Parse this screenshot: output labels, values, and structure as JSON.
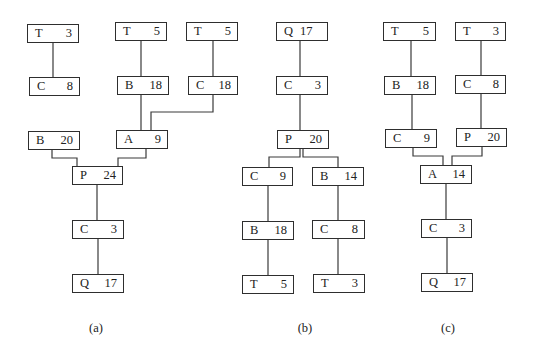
{
  "diagram": {
    "title": "",
    "colors": {
      "line": "#3a3a3a",
      "box_border": "#2e2e2e",
      "text": "#222222",
      "background": "#ffffff"
    },
    "panels": [
      {
        "id": "a",
        "caption": "(a)",
        "caption_pos": [
          96,
          321
        ],
        "nodes": [
          {
            "id": "a_t3",
            "label": "T",
            "value": "3",
            "x": 27,
            "y": 24,
            "w": 52
          },
          {
            "id": "a_t5_1",
            "label": "T",
            "value": "5",
            "x": 115,
            "y": 22,
            "w": 52
          },
          {
            "id": "a_t5_2",
            "label": "T",
            "value": "5",
            "x": 186,
            "y": 22,
            "w": 52
          },
          {
            "id": "a_c8",
            "label": "C",
            "value": "8",
            "x": 29,
            "y": 77,
            "w": 51
          },
          {
            "id": "a_b18",
            "label": "B",
            "value": "18",
            "x": 117,
            "y": 76,
            "w": 52
          },
          {
            "id": "a_c18",
            "label": "C",
            "value": "18",
            "x": 188,
            "y": 76,
            "w": 50
          },
          {
            "id": "a_b20",
            "label": "B",
            "value": "20",
            "x": 28,
            "y": 131,
            "w": 52
          },
          {
            "id": "a_a9",
            "label": "A",
            "value": "9",
            "x": 116,
            "y": 130,
            "w": 52
          },
          {
            "id": "a_p24",
            "label": "P",
            "value": "24",
            "x": 72,
            "y": 166,
            "w": 51
          },
          {
            "id": "a_c3",
            "label": "C",
            "value": "3",
            "x": 72,
            "y": 220,
            "w": 52
          },
          {
            "id": "a_q17",
            "label": "Q",
            "value": "17",
            "x": 72,
            "y": 274,
            "w": 52
          }
        ],
        "edges": [
          "53,43 53,77",
          "141,41 141,130",
          "213,41 213,76",
          "213,95 213,112 151,112 151,130",
          "52,150 52,158 77,158 77,166",
          "146,149 146,158 118,158 118,166",
          "97,185 97,220",
          "98,239 98,274"
        ]
      },
      {
        "id": "b",
        "caption": "(b)",
        "caption_pos": [
          305,
          321
        ],
        "nodes": [
          {
            "id": "b_q17",
            "label": "Q",
            "value": "17",
            "x": 276,
            "y": 22,
            "w": 52,
            "compact": true
          },
          {
            "id": "b_c3",
            "label": "C",
            "value": "3",
            "x": 276,
            "y": 76,
            "w": 52
          },
          {
            "id": "b_p20",
            "label": "P",
            "value": "20",
            "x": 277,
            "y": 130,
            "w": 52
          },
          {
            "id": "b_c9",
            "label": "C",
            "value": "9",
            "x": 242,
            "y": 167,
            "w": 51
          },
          {
            "id": "b_b14",
            "label": "B",
            "value": "14",
            "x": 312,
            "y": 167,
            "w": 52
          },
          {
            "id": "b_b18",
            "label": "B",
            "value": "18",
            "x": 242,
            "y": 221,
            "w": 52
          },
          {
            "id": "b_c8",
            "label": "C",
            "value": "8",
            "x": 312,
            "y": 220,
            "w": 53
          },
          {
            "id": "b_t5",
            "label": "T",
            "value": "5",
            "x": 242,
            "y": 275,
            "w": 52
          },
          {
            "id": "b_t3",
            "label": "T",
            "value": "3",
            "x": 313,
            "y": 274,
            "w": 52
          }
        ],
        "edges": [
          "300,41 300,76",
          "300,95 300,130",
          "300,149 300,157 269,157 269,167",
          "303,149 303,157 338,157 338,167",
          "268,186 268,221",
          "338,186 338,220",
          "268,240 268,275",
          "338,239 338,274"
        ]
      },
      {
        "id": "c",
        "caption": "(c)",
        "caption_pos": [
          448,
          321
        ],
        "nodes": [
          {
            "id": "c_t5",
            "label": "T",
            "value": "5",
            "x": 383,
            "y": 22,
            "w": 53
          },
          {
            "id": "c_t3",
            "label": "T",
            "value": "3",
            "x": 455,
            "y": 22,
            "w": 51
          },
          {
            "id": "c_b18",
            "label": "B",
            "value": "18",
            "x": 384,
            "y": 76,
            "w": 52
          },
          {
            "id": "c_c8",
            "label": "C",
            "value": "8",
            "x": 455,
            "y": 75,
            "w": 51
          },
          {
            "id": "c_c9",
            "label": "C",
            "value": "9",
            "x": 385,
            "y": 129,
            "w": 52
          },
          {
            "id": "c_p20",
            "label": "P",
            "value": "20",
            "x": 456,
            "y": 128,
            "w": 51
          },
          {
            "id": "c_a14",
            "label": "A",
            "value": "14",
            "x": 420,
            "y": 165,
            "w": 52
          },
          {
            "id": "c_c3",
            "label": "C",
            "value": "3",
            "x": 421,
            "y": 219,
            "w": 51
          },
          {
            "id": "c_q17",
            "label": "Q",
            "value": "17",
            "x": 421,
            "y": 273,
            "w": 52
          }
        ],
        "edges": [
          "411,41 411,76",
          "481,41 481,75",
          "412,95 412,129",
          "481,94 481,128",
          "413,148 413,156 443,156 443,165",
          "482,147 482,156 452,156 452,165",
          "446,184 446,219",
          "447,238 447,273"
        ]
      }
    ]
  }
}
